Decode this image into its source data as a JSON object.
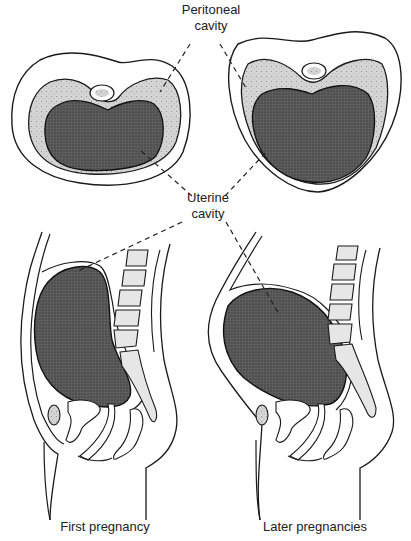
{
  "figure": {
    "type": "anatomical-diagram",
    "labels": {
      "peritoneal_line1": "Peritoneal",
      "peritoneal_line2": "cavity",
      "uterine_line1": "Uterine",
      "uterine_line2": "cavity"
    },
    "captions": {
      "first": "First pregnancy",
      "later": "Later pregnancies"
    },
    "panels": [
      {
        "id": "transverse-first",
        "view": "transverse section",
        "column": "First pregnancy"
      },
      {
        "id": "transverse-later",
        "view": "transverse section",
        "column": "Later pregnancies"
      },
      {
        "id": "sagittal-first",
        "view": "sagittal section",
        "column": "First pregnancy"
      },
      {
        "id": "sagittal-later",
        "view": "sagittal section",
        "column": "Later pregnancies"
      }
    ],
    "colors": {
      "background": "#ffffff",
      "outline": "#1a1a1a",
      "uterine_cavity_fill": "#555555",
      "peritoneal_cavity_fill": "#cfcfcf",
      "vertebra_fill": "#e6e6e6",
      "leader_line": "#222222"
    }
  }
}
